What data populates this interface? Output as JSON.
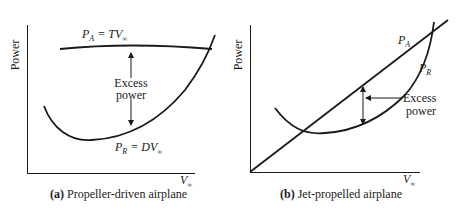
{
  "figure": {
    "panels": [
      {
        "id": "a",
        "caption_letter": "(a)",
        "caption_text": " Propeller-driven airplane",
        "ylabel": "Power",
        "xlabel_main": "V",
        "xlabel_sub": "∞",
        "curves": {
          "available": {
            "main": "P",
            "sub": "A",
            "eq": " = TV",
            "eq_sub": "∞"
          },
          "required": {
            "main": "P",
            "sub": "R",
            "eq": " = DV",
            "eq_sub": "∞"
          }
        },
        "annotation": {
          "line1": "Excess",
          "line2": "power"
        }
      },
      {
        "id": "b",
        "caption_letter": "(b)",
        "caption_text": " Jet-propelled airplane",
        "ylabel": "Power",
        "xlabel_main": "V",
        "xlabel_sub": "∞",
        "curves": {
          "available": {
            "main": "P",
            "sub": "A"
          },
          "required": {
            "main": "P",
            "sub": "R"
          }
        },
        "annotation": {
          "line1": "Excess",
          "line2": "power"
        }
      }
    ],
    "colors": {
      "ink": "#1a1a1a",
      "background": "#ffffff"
    }
  }
}
